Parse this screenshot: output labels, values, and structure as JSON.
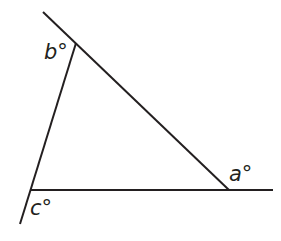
{
  "diagram": {
    "type": "triangle-angles",
    "stroke_color": "#231f20",
    "background": "#ffffff",
    "lines": [
      {
        "name": "line-top-diagonal",
        "x1": 43,
        "y1": 12,
        "x2": 229,
        "y2": 190
      },
      {
        "name": "line-left-slanted",
        "x1": 76,
        "y1": 43,
        "x2": 20,
        "y2": 224
      },
      {
        "name": "line-base",
        "x1": 31,
        "y1": 190,
        "x2": 273,
        "y2": 190
      }
    ],
    "labels": {
      "a": {
        "text": "a°",
        "x": 229,
        "y": 181
      },
      "b": {
        "text": "b°",
        "x": 44,
        "y": 59
      },
      "c": {
        "text": "c°",
        "x": 30,
        "y": 215
      }
    }
  }
}
